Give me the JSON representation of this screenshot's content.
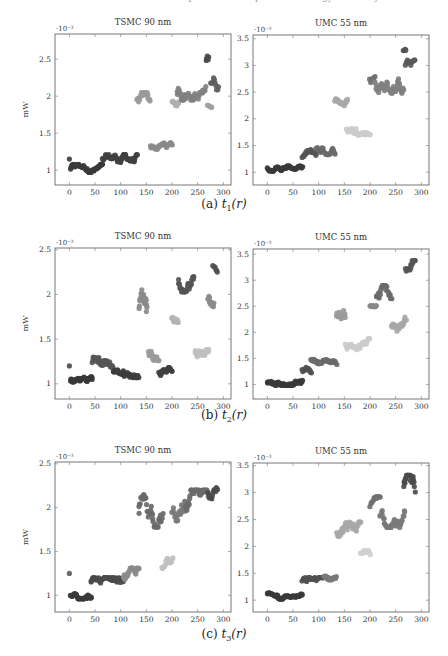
{
  "page": {
    "top_cut_text": "Table: estimated power consumption and energy efficiency"
  },
  "chart_data": [
    {
      "id": "a-left",
      "figure": "a",
      "type": "scatter",
      "title": "TSMC 90 nm",
      "xlabel": "",
      "ylabel": "mW",
      "y_multiplier": "·10⁻³",
      "xlim": [
        -28,
        315
      ],
      "ylim": [
        0.8,
        2.84
      ],
      "xticks": [
        0,
        50,
        100,
        150,
        200,
        250,
        300
      ],
      "yticks": [
        1,
        1.5,
        2,
        2.5
      ],
      "ytick_labels": [
        "1",
        "1.5",
        "2",
        "2.5"
      ],
      "frame": {
        "x": 55,
        "y": 34,
        "w": 176,
        "h": 151
      },
      "clusters": [
        {
          "x0": 0,
          "x1": 0,
          "ys": [
            1.15
          ],
          "color": "#4a4a4a"
        },
        {
          "x0": 2,
          "x1": 65,
          "ymin": 0.97,
          "ymax": 1.08,
          "n": 55,
          "color": "#3a3a3a"
        },
        {
          "x0": 65,
          "x1": 132,
          "ymin": 1.06,
          "ymax": 1.21,
          "n": 60,
          "color": "#404040"
        },
        {
          "x0": 132,
          "x1": 158,
          "ymin": 1.8,
          "ymax": 2.05,
          "n": 20,
          "color": "#9a9a9a"
        },
        {
          "x0": 158,
          "x1": 200,
          "ymin": 1.24,
          "ymax": 1.37,
          "n": 30,
          "color": "#8a8a8a"
        },
        {
          "x0": 200,
          "x1": 213,
          "ymin": 1.85,
          "ymax": 2.0,
          "n": 10,
          "color": "#b0b0b0"
        },
        {
          "x0": 210,
          "x1": 265,
          "ymin": 1.95,
          "ymax": 2.2,
          "n": 45,
          "color": "#808080"
        },
        {
          "x0": 266,
          "x1": 272,
          "ymin": 2.4,
          "ymax": 2.65,
          "n": 6,
          "color": "#4a4a4a"
        },
        {
          "x0": 270,
          "x1": 278,
          "ymin": 1.85,
          "ymax": 1.95,
          "n": 5,
          "color": "#a0a0a0"
        },
        {
          "x0": 276,
          "x1": 290,
          "ymin": 2.05,
          "ymax": 2.33,
          "n": 10,
          "color": "#606060"
        }
      ]
    },
    {
      "id": "a-right",
      "figure": "a",
      "type": "scatter",
      "title": "UMC 55 nm",
      "xlabel": "",
      "ylabel": "",
      "y_multiplier": "·10⁻³",
      "xlim": [
        -28,
        315
      ],
      "ylim": [
        0.76,
        3.57
      ],
      "xticks": [
        0,
        50,
        100,
        150,
        200,
        250,
        300
      ],
      "yticks": [
        1,
        1.5,
        2,
        2.5,
        3,
        3.5
      ],
      "ytick_labels": [
        "1",
        "1.5",
        "2",
        "2.5",
        "3",
        "3.5"
      ],
      "frame": {
        "x": 253,
        "y": 35,
        "w": 176,
        "h": 150
      },
      "clusters": [
        {
          "x0": 0,
          "x1": 68,
          "ymin": 1.02,
          "ymax": 1.12,
          "n": 60,
          "color": "#3a3a3a"
        },
        {
          "x0": 68,
          "x1": 95,
          "ymin": 1.18,
          "ymax": 1.42,
          "n": 22,
          "color": "#555555"
        },
        {
          "x0": 95,
          "x1": 132,
          "ymin": 1.33,
          "ymax": 1.52,
          "n": 30,
          "color": "#6a6a6a"
        },
        {
          "x0": 132,
          "x1": 157,
          "ymin": 2.18,
          "ymax": 2.42,
          "n": 20,
          "color": "#a8a8a8"
        },
        {
          "x0": 155,
          "x1": 200,
          "ymin": 1.7,
          "ymax": 1.95,
          "n": 35,
          "color": "#cccccc"
        },
        {
          "x0": 200,
          "x1": 210,
          "ymin": 2.6,
          "ymax": 2.9,
          "n": 8,
          "color": "#707070"
        },
        {
          "x0": 210,
          "x1": 265,
          "ymin": 2.48,
          "ymax": 2.85,
          "n": 45,
          "color": "#808080"
        },
        {
          "x0": 265,
          "x1": 270,
          "ymin": 3.22,
          "ymax": 3.35,
          "n": 5,
          "color": "#555555"
        },
        {
          "x0": 270,
          "x1": 288,
          "ymin": 2.85,
          "ymax": 3.1,
          "n": 15,
          "color": "#5a5a5a"
        }
      ]
    },
    {
      "id": "b-left",
      "figure": "b",
      "type": "scatter",
      "title": "TSMC 90 nm",
      "xlabel": "",
      "ylabel": "mW",
      "y_multiplier": "·10⁻³",
      "xlim": [
        -28,
        315
      ],
      "ylim": [
        0.83,
        2.52
      ],
      "xticks": [
        0,
        50,
        100,
        150,
        200,
        250,
        300
      ],
      "yticks": [
        1,
        1.5,
        2,
        2.5
      ],
      "ytick_labels": [
        "1",
        "1.5",
        "2",
        "2.5"
      ],
      "frame": {
        "x": 55,
        "y": 248,
        "w": 176,
        "h": 151
      },
      "clusters": [
        {
          "x0": 0,
          "x1": 0,
          "ys": [
            1.2
          ],
          "color": "#5a5a5a"
        },
        {
          "x0": 2,
          "x1": 45,
          "ymin": 0.98,
          "ymax": 1.09,
          "n": 40,
          "color": "#3a3a3a"
        },
        {
          "x0": 45,
          "x1": 85,
          "ymin": 1.12,
          "ymax": 1.3,
          "n": 35,
          "color": "#555555"
        },
        {
          "x0": 85,
          "x1": 135,
          "ymin": 1.07,
          "ymax": 1.18,
          "n": 45,
          "color": "#3e3e3e"
        },
        {
          "x0": 135,
          "x1": 152,
          "ymin": 1.7,
          "ymax": 2.07,
          "n": 18,
          "color": "#8a8a8a"
        },
        {
          "x0": 155,
          "x1": 175,
          "ymin": 1.26,
          "ymax": 1.45,
          "n": 20,
          "color": "#9a9a9a"
        },
        {
          "x0": 175,
          "x1": 200,
          "ymin": 1.08,
          "ymax": 1.18,
          "n": 25,
          "color": "#404040"
        },
        {
          "x0": 200,
          "x1": 213,
          "ymin": 1.63,
          "ymax": 1.82,
          "n": 10,
          "color": "#b4b4b4"
        },
        {
          "x0": 212,
          "x1": 242,
          "ymin": 2.03,
          "ymax": 2.29,
          "n": 28,
          "color": "#555555"
        },
        {
          "x0": 245,
          "x1": 272,
          "ymin": 1.3,
          "ymax": 1.45,
          "n": 30,
          "color": "#c0c0c0"
        },
        {
          "x0": 270,
          "x1": 282,
          "ymin": 1.8,
          "ymax": 2.02,
          "n": 10,
          "color": "#8a8a8a"
        },
        {
          "x0": 280,
          "x1": 288,
          "ymin": 2.25,
          "ymax": 2.38,
          "n": 6,
          "color": "#505050"
        }
      ]
    },
    {
      "id": "b-right",
      "figure": "b",
      "type": "scatter",
      "title": "UMC 55 nm",
      "xlabel": "",
      "ylabel": "",
      "y_multiplier": "·10⁻³",
      "xlim": [
        -28,
        315
      ],
      "ylim": [
        0.72,
        3.6
      ],
      "xticks": [
        0,
        50,
        100,
        150,
        200,
        250,
        300
      ],
      "yticks": [
        1,
        1.5,
        2,
        2.5,
        3,
        3.5
      ],
      "ytick_labels": [
        "1",
        "1.5",
        "2",
        "2.5",
        "3",
        "3.5"
      ],
      "frame": {
        "x": 253,
        "y": 249,
        "w": 176,
        "h": 150
      },
      "clusters": [
        {
          "x0": 0,
          "x1": 68,
          "ymin": 0.98,
          "ymax": 1.12,
          "n": 60,
          "color": "#3a3a3a"
        },
        {
          "x0": 68,
          "x1": 85,
          "ymin": 1.2,
          "ymax": 1.38,
          "n": 14,
          "color": "#505050"
        },
        {
          "x0": 85,
          "x1": 135,
          "ymin": 1.38,
          "ymax": 1.52,
          "n": 40,
          "color": "#6a6a6a"
        },
        {
          "x0": 135,
          "x1": 152,
          "ymin": 2.1,
          "ymax": 2.42,
          "n": 14,
          "color": "#9a9a9a"
        },
        {
          "x0": 152,
          "x1": 200,
          "ymin": 1.62,
          "ymax": 1.88,
          "n": 35,
          "color": "#cccccc"
        },
        {
          "x0": 200,
          "x1": 212,
          "ymin": 2.45,
          "ymax": 2.55,
          "n": 10,
          "color": "#888888"
        },
        {
          "x0": 212,
          "x1": 242,
          "ymin": 2.48,
          "ymax": 2.9,
          "n": 25,
          "color": "#6a6a6a"
        },
        {
          "x0": 242,
          "x1": 270,
          "ymin": 1.98,
          "ymax": 2.3,
          "n": 25,
          "color": "#a8a8a8"
        },
        {
          "x0": 270,
          "x1": 288,
          "ymin": 2.92,
          "ymax": 3.38,
          "n": 15,
          "color": "#555555"
        }
      ]
    },
    {
      "id": "c-left",
      "figure": "c",
      "type": "scatter",
      "title": "TSMC 90 nm",
      "xlabel": "",
      "ylabel": "mW",
      "y_multiplier": "·10⁻³",
      "xlim": [
        -28,
        315
      ],
      "ylim": [
        0.81,
        2.52
      ],
      "xticks": [
        0,
        50,
        100,
        150,
        200,
        250,
        300
      ],
      "yticks": [
        1,
        1.5,
        2,
        2.5
      ],
      "ytick_labels": [
        "1",
        "1.5",
        "2",
        "2.5"
      ],
      "frame": {
        "x": 55,
        "y": 462,
        "w": 176,
        "h": 150
      },
      "clusters": [
        {
          "x0": 0,
          "x1": 0,
          "ys": [
            1.25
          ],
          "color": "#6a6a6a"
        },
        {
          "x0": 2,
          "x1": 42,
          "ymin": 0.96,
          "ymax": 1.04,
          "n": 40,
          "color": "#3a3a3a"
        },
        {
          "x0": 42,
          "x1": 105,
          "ymin": 1.06,
          "ymax": 1.2,
          "n": 55,
          "color": "#4a4a4a"
        },
        {
          "x0": 105,
          "x1": 135,
          "ymin": 1.15,
          "ymax": 1.31,
          "n": 25,
          "color": "#8a8a8a"
        },
        {
          "x0": 135,
          "x1": 182,
          "ymin": 1.78,
          "ymax": 2.15,
          "n": 40,
          "color": "#6a6a6a"
        },
        {
          "x0": 180,
          "x1": 202,
          "ymin": 1.26,
          "ymax": 1.44,
          "n": 14,
          "color": "#c0c0c0"
        },
        {
          "x0": 200,
          "x1": 228,
          "ymin": 1.85,
          "ymax": 2.15,
          "n": 20,
          "color": "#7a7a7a"
        },
        {
          "x0": 225,
          "x1": 270,
          "ymin": 1.85,
          "ymax": 2.2,
          "n": 35,
          "color": "#6a6a6a"
        },
        {
          "x0": 270,
          "x1": 288,
          "ymin": 2.1,
          "ymax": 2.36,
          "n": 12,
          "color": "#4a4a4a"
        }
      ]
    },
    {
      "id": "c-right",
      "figure": "c",
      "type": "scatter",
      "title": "UMC 55 nm",
      "xlabel": "",
      "ylabel": "",
      "y_multiplier": "·10⁻³",
      "xlim": [
        -28,
        315
      ],
      "ylim": [
        0.78,
        3.55
      ],
      "xticks": [
        0,
        50,
        100,
        150,
        200,
        250,
        300
      ],
      "yticks": [
        1,
        1.5,
        2,
        2.5,
        3,
        3.5
      ],
      "ytick_labels": [
        "1",
        "1.5",
        "2",
        "2.5",
        "3",
        "3.5"
      ],
      "frame": {
        "x": 253,
        "y": 463,
        "w": 176,
        "h": 149
      },
      "clusters": [
        {
          "x0": 0,
          "x1": 20,
          "ymin": 1.08,
          "ymax": 1.16,
          "n": 18,
          "color": "#3a3a3a"
        },
        {
          "x0": 20,
          "x1": 68,
          "ymin": 1.02,
          "ymax": 1.12,
          "n": 40,
          "color": "#3a3a3a"
        },
        {
          "x0": 68,
          "x1": 110,
          "ymin": 1.25,
          "ymax": 1.42,
          "n": 35,
          "color": "#505050"
        },
        {
          "x0": 110,
          "x1": 135,
          "ymin": 1.38,
          "ymax": 1.58,
          "n": 22,
          "color": "#7a7a7a"
        },
        {
          "x0": 135,
          "x1": 182,
          "ymin": 2.15,
          "ymax": 2.45,
          "n": 40,
          "color": "#a8a8a8"
        },
        {
          "x0": 182,
          "x1": 200,
          "ymin": 1.75,
          "ymax": 1.95,
          "n": 12,
          "color": "#cfcfcf"
        },
        {
          "x0": 200,
          "x1": 220,
          "ymin": 2.65,
          "ymax": 2.92,
          "n": 14,
          "color": "#707070"
        },
        {
          "x0": 220,
          "x1": 268,
          "ymin": 2.35,
          "ymax": 2.8,
          "n": 40,
          "color": "#7a7a7a"
        },
        {
          "x0": 265,
          "x1": 288,
          "ymin": 2.8,
          "ymax": 3.32,
          "n": 22,
          "color": "#4a4a4a"
        }
      ]
    }
  ],
  "captions": {
    "a": {
      "label": "(a)",
      "func": "t",
      "sub": "1",
      "arg": "(r)"
    },
    "b": {
      "label": "(b)",
      "func": "t",
      "sub": "2",
      "arg": "(r)"
    },
    "c": {
      "label": "(c)",
      "func": "t",
      "sub": "3",
      "arg": "(r)"
    }
  }
}
